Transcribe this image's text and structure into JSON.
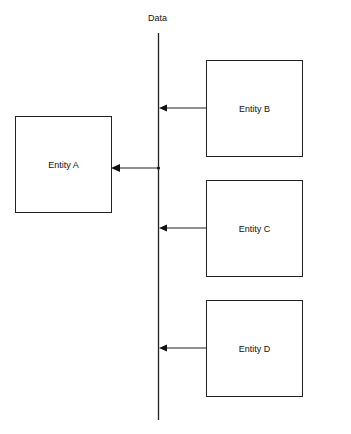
{
  "diagram": {
    "bus": {
      "label": "Data"
    },
    "entities": [
      {
        "id": "A",
        "label": "Entity A"
      },
      {
        "id": "B",
        "label": "Entity B"
      },
      {
        "id": "C",
        "label": "Entity C"
      },
      {
        "id": "D",
        "label": "Entity D"
      }
    ],
    "edges": [
      {
        "from": "B",
        "to": "Data bus"
      },
      {
        "from": "C",
        "to": "Data bus"
      },
      {
        "from": "D",
        "to": "Data bus"
      },
      {
        "from": "Data bus",
        "to": "A"
      }
    ]
  }
}
